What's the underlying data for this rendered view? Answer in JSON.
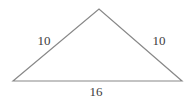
{
  "figure": {
    "type": "isosceles-triangle",
    "line_color": "#888888",
    "text_color": "#3d3d3d",
    "labels": {
      "left_side": "10",
      "right_side": "10",
      "base": "16"
    }
  }
}
